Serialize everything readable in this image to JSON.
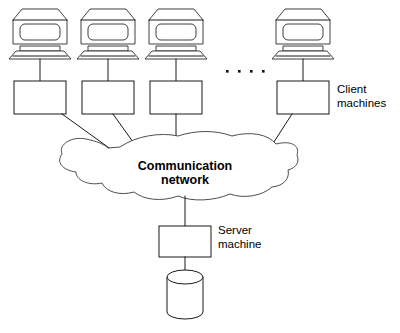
{
  "diagram": {
    "background_color": "#ffffff",
    "line_color": "#000000",
    "cloud_label_line_1": "Communication",
    "cloud_label_line_2": "network",
    "client_label_line_1": "Client",
    "client_label_line_2": "machines",
    "server_label_line_1": "Server",
    "server_label_line_2": "machine",
    "ellipsis_dots": 4,
    "client_count_shown": 4,
    "nodes": [
      {
        "name": "client-1",
        "icon": "desktop-computer-icon",
        "box": "client-box-1"
      },
      {
        "name": "client-2",
        "icon": "desktop-computer-icon",
        "box": "client-box-2"
      },
      {
        "name": "client-3",
        "icon": "desktop-computer-icon",
        "box": "client-box-3"
      },
      {
        "name": "client-n",
        "icon": "desktop-computer-icon",
        "box": "client-box-n"
      },
      {
        "name": "server",
        "icon": "none",
        "box": "server-box"
      },
      {
        "name": "database",
        "icon": "database-cylinder-icon",
        "box": "none"
      }
    ]
  }
}
